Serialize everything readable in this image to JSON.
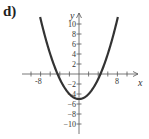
{
  "figure": {
    "label": "d)"
  },
  "chart_data": {
    "type": "line",
    "title": "",
    "xlabel": "x",
    "ylabel": "y",
    "function": "y = x^2/4 - 5",
    "xlim": [
      -10,
      10
    ],
    "ylim": [
      -12,
      12
    ],
    "x_tick_labels": [
      "-8",
      "8"
    ],
    "y_tick_labels": [
      "10",
      "8",
      "6",
      "4",
      "2",
      "-2",
      "-4",
      "-6",
      "-8",
      "-10"
    ],
    "x_tick_step": 2,
    "y_tick_step": 2,
    "grid": false,
    "series": [
      {
        "name": "parabola",
        "x": [
          -8,
          -6,
          -4,
          -2,
          0,
          2,
          4,
          6,
          8
        ],
        "values": [
          11,
          4,
          -1,
          -4,
          -5,
          -4,
          -1,
          4,
          11
        ]
      }
    ],
    "vertex": [
      0,
      -5
    ],
    "x_intercepts": [
      -4.47,
      4.47
    ],
    "curve_color": "#333333"
  }
}
